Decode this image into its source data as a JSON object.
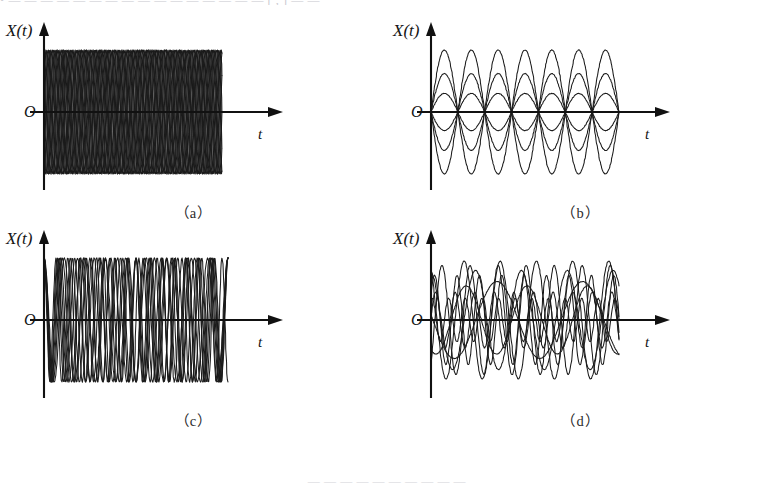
{
  "page": {
    "top_cut_text": "• — — — —  — — —  — — — —  — —  — — —  [ , ] — —",
    "bottom_cut_text": "— — — — — —  — — — —",
    "background_color": "#ffffff",
    "ink_color": "#1b1b1b"
  },
  "panels": [
    {
      "id": "a",
      "caption": "（a）",
      "y_axis_label": "X(t)",
      "x_axis_label": "t",
      "origin_label": "O",
      "description": "equal amplitude, equal frequency, random phase"
    },
    {
      "id": "b",
      "caption": "（b）",
      "y_axis_label": "X(t)",
      "x_axis_label": "t",
      "origin_label": "O",
      "description": "random amplitude, equal frequency, equal phase"
    },
    {
      "id": "c",
      "caption": "（c）",
      "y_axis_label": "X(t)",
      "x_axis_label": "t",
      "origin_label": "O",
      "description": "equal amplitude, random frequency, equal phase"
    },
    {
      "id": "d",
      "caption": "（d）",
      "y_axis_label": "X(t)",
      "x_axis_label": "t",
      "origin_label": "O",
      "description": "random amplitude, random frequency, random phase"
    }
  ],
  "chart_data": [
    {
      "type": "line",
      "panel": "a",
      "title": "（a）",
      "xlabel": "t",
      "ylabel": "X(t)",
      "xlim": [
        0,
        1
      ],
      "ylim": [
        -1.25,
        1.25
      ],
      "grid": false,
      "legend": "none",
      "x_domain_px": [
        44,
        222
      ],
      "series": [
        {
          "name": "s1",
          "amplitude": 1.0,
          "frequency": 14,
          "phase": 0.0
        },
        {
          "name": "s2",
          "amplitude": 1.0,
          "frequency": 14,
          "phase": 0.63
        },
        {
          "name": "s3",
          "amplitude": 1.0,
          "frequency": 14,
          "phase": 1.26
        },
        {
          "name": "s4",
          "amplitude": 1.0,
          "frequency": 14,
          "phase": 1.88
        },
        {
          "name": "s5",
          "amplitude": 1.0,
          "frequency": 14,
          "phase": 2.51
        },
        {
          "name": "s6",
          "amplitude": 1.0,
          "frequency": 14,
          "phase": 3.14
        },
        {
          "name": "s7",
          "amplitude": 1.0,
          "frequency": 14,
          "phase": 3.77
        },
        {
          "name": "s8",
          "amplitude": 1.0,
          "frequency": 14,
          "phase": 4.4
        },
        {
          "name": "s9",
          "amplitude": 1.0,
          "frequency": 14,
          "phase": 5.03
        },
        {
          "name": "s10",
          "amplitude": 1.0,
          "frequency": 14,
          "phase": 5.65
        }
      ]
    },
    {
      "type": "line",
      "panel": "b",
      "title": "（b）",
      "xlabel": "t",
      "ylabel": "X(t)",
      "xlim": [
        0,
        1
      ],
      "ylim": [
        -1.25,
        1.25
      ],
      "grid": false,
      "legend": "none",
      "x_domain_px": [
        44,
        222
      ],
      "series": [
        {
          "name": "s1",
          "amplitude": 1.0,
          "frequency": 3.5,
          "phase": 0
        },
        {
          "name": "s2",
          "amplitude": 0.62,
          "frequency": 3.5,
          "phase": 0
        },
        {
          "name": "s3",
          "amplitude": 0.3,
          "frequency": 3.5,
          "phase": 0
        },
        {
          "name": "s4",
          "amplitude": -0.3,
          "frequency": 3.5,
          "phase": 0
        },
        {
          "name": "s5",
          "amplitude": -0.62,
          "frequency": 3.5,
          "phase": 0
        },
        {
          "name": "s6",
          "amplitude": -1.0,
          "frequency": 3.5,
          "phase": 0
        }
      ]
    },
    {
      "type": "line",
      "panel": "c",
      "title": "（c）",
      "xlabel": "t",
      "ylabel": "X(t)",
      "xlim": [
        0,
        1
      ],
      "ylim": [
        -1.25,
        1.25
      ],
      "grid": false,
      "legend": "none",
      "x_domain_px": [
        44,
        222
      ],
      "series": [
        {
          "name": "s1",
          "amplitude": 1.0,
          "frequency": 9.0,
          "phase": 1.5708
        },
        {
          "name": "s2",
          "amplitude": 1.0,
          "frequency": 10.0,
          "phase": 1.5708
        },
        {
          "name": "s3",
          "amplitude": 1.0,
          "frequency": 11.0,
          "phase": 1.5708
        },
        {
          "name": "s4",
          "amplitude": 1.0,
          "frequency": 12.0,
          "phase": 1.5708
        },
        {
          "name": "s5",
          "amplitude": 1.0,
          "frequency": 13.0,
          "phase": 1.5708
        },
        {
          "name": "s6",
          "amplitude": 1.0,
          "frequency": 14.0,
          "phase": 1.5708
        },
        {
          "name": "s7",
          "amplitude": 1.0,
          "frequency": 15.5,
          "phase": 1.5708
        }
      ]
    },
    {
      "type": "line",
      "panel": "d",
      "title": "（d）",
      "xlabel": "t",
      "ylabel": "X(t)",
      "xlim": [
        0,
        1
      ],
      "ylim": [
        -1.25,
        1.25
      ],
      "grid": false,
      "legend": "none",
      "x_domain_px": [
        44,
        222
      ],
      "series": [
        {
          "name": "s1",
          "amplitude": 0.95,
          "frequency": 5.2,
          "phase": 2.1
        },
        {
          "name": "s2",
          "amplitude": 0.72,
          "frequency": 8.4,
          "phase": 0.55
        },
        {
          "name": "s3",
          "amplitude": 0.55,
          "frequency": 3.1,
          "phase": 4.2
        },
        {
          "name": "s4",
          "amplitude": 0.88,
          "frequency": 6.7,
          "phase": 5.4
        },
        {
          "name": "s5",
          "amplitude": 0.35,
          "frequency": 11.3,
          "phase": 1.2
        },
        {
          "name": "s6",
          "amplitude": 0.62,
          "frequency": 2.2,
          "phase": 3.0
        },
        {
          "name": "s7",
          "amplitude": 0.45,
          "frequency": 9.6,
          "phase": 0.1
        },
        {
          "name": "s8",
          "amplitude": 0.8,
          "frequency": 4.1,
          "phase": 1.75
        }
      ]
    }
  ]
}
